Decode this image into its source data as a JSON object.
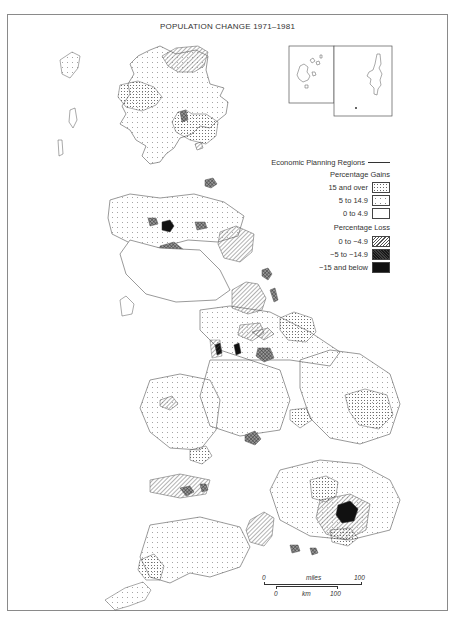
{
  "title": "POPULATION CHANGE 1971–1981",
  "legend": {
    "boundary_label": "Economic Planning Regions",
    "gains_header": "Percentage Gains",
    "gains": [
      {
        "label": "15 and over",
        "pattern": "dense-dots"
      },
      {
        "label": "5 to 14.9",
        "pattern": "sparse-dots"
      },
      {
        "label": "0 to  4.9",
        "pattern": "blank"
      }
    ],
    "loss_header": "Percentage Loss",
    "losses": [
      {
        "label": "0 to  −4.9",
        "pattern": "diagonal-hatch"
      },
      {
        "label": "−5 to  −14.9",
        "pattern": "cross-hatch"
      },
      {
        "label": "−15 and below",
        "pattern": "solid-black"
      }
    ]
  },
  "scale": {
    "miles_start": "0",
    "miles_label": "miles",
    "miles_end": "100",
    "km_start": "0",
    "km_label": "km",
    "km_end": "100"
  },
  "insets": [
    "Orkney",
    "Shetland"
  ],
  "colors": {
    "outline": "#555555",
    "frame": "#8a8a8a",
    "black_fill": "#111111"
  }
}
